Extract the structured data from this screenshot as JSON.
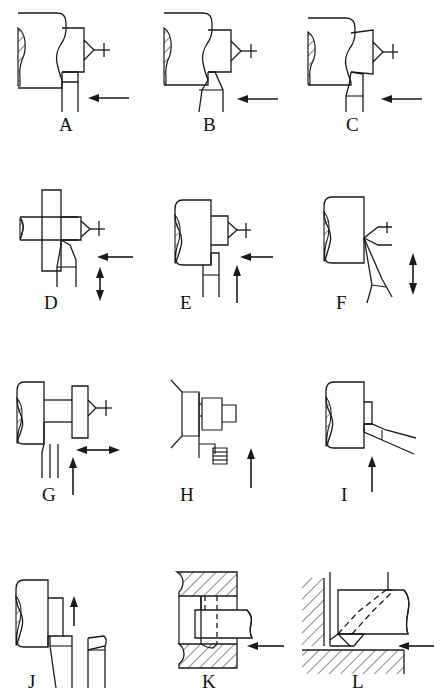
{
  "figure": {
    "stroke_color": "#1a1a1a",
    "background_color": "#ffffff",
    "columns": 3,
    "rows": 4
  },
  "panels": [
    {
      "id": "A",
      "label": "A",
      "operation": "straight-longitudinal-turning",
      "workpiece": "shaft-held-between-centers",
      "tool": "straight-turning-tool",
      "feed_arrows": [
        {
          "name": "feed-arrow-left",
          "direction": "left",
          "style": "single"
        }
      ]
    },
    {
      "id": "B",
      "label": "B",
      "operation": "longitudinal-turning-angled-tool",
      "workpiece": "shaft-held-between-centers",
      "tool": "angled-turning-tool",
      "feed_arrows": [
        {
          "name": "feed-arrow-left",
          "direction": "left",
          "style": "single"
        }
      ]
    },
    {
      "id": "C",
      "label": "C",
      "operation": "longitudinal-turning-round-nose-tool",
      "workpiece": "shaft-held-between-centers",
      "tool": "round-nose-turning-tool",
      "feed_arrows": [
        {
          "name": "feed-arrow-left",
          "direction": "left",
          "style": "single"
        }
      ]
    },
    {
      "id": "D",
      "label": "D",
      "operation": "form-turning-with-shoulder",
      "workpiece": "shaft-with-flange",
      "tool": "angled-form-tool",
      "feed_arrows": [
        {
          "name": "feed-arrow-left",
          "direction": "left",
          "style": "single"
        },
        {
          "name": "feed-arrow-vertical-double",
          "direction": "vertical",
          "style": "double"
        }
      ]
    },
    {
      "id": "E",
      "label": "E",
      "operation": "facing-and-turning-combined",
      "workpiece": "shaft-held-between-centers",
      "tool": "square-shoulder-tool",
      "feed_arrows": [
        {
          "name": "feed-arrow-left",
          "direction": "left",
          "style": "single"
        },
        {
          "name": "feed-arrow-up",
          "direction": "up",
          "style": "single"
        }
      ]
    },
    {
      "id": "F",
      "label": "F",
      "operation": "facing-end-of-workpiece",
      "workpiece": "shaft-held-between-centers",
      "tool": "facing-tool-angled",
      "feed_arrows": [
        {
          "name": "feed-arrow-vertical-double",
          "direction": "vertical",
          "style": "double"
        }
      ]
    },
    {
      "id": "G",
      "label": "G",
      "operation": "grooving-and-parting",
      "workpiece": "shaft-with-collar",
      "tool": "grooving-tool-pair",
      "feed_arrows": [
        {
          "name": "feed-arrow-horizontal-double",
          "direction": "horizontal",
          "style": "double"
        },
        {
          "name": "feed-arrow-up",
          "direction": "up",
          "style": "single"
        }
      ]
    },
    {
      "id": "H",
      "label": "H",
      "operation": "thread-cutting",
      "workpiece": "stepped-shaft",
      "tool": "threading-tool",
      "feed_arrows": [
        {
          "name": "feed-arrow-up",
          "direction": "up",
          "style": "single"
        }
      ]
    },
    {
      "id": "I",
      "label": "I",
      "operation": "chamfering-taper-turning",
      "workpiece": "shaft-held-between-centers",
      "tool": "chamfer-tool",
      "feed_arrows": [
        {
          "name": "feed-arrow-up",
          "direction": "up",
          "style": "single"
        }
      ]
    },
    {
      "id": "J",
      "label": "J",
      "operation": "parting-off",
      "workpiece": "shaft-end",
      "tool": "parting-blade",
      "feed_arrows": [
        {
          "name": "feed-arrow-up",
          "direction": "up",
          "style": "single"
        }
      ]
    },
    {
      "id": "K",
      "label": "K",
      "operation": "internal-boring",
      "workpiece": "hollow-bored-part-sectioned",
      "tool": "boring-bar",
      "feed_arrows": [
        {
          "name": "feed-arrow-left",
          "direction": "left",
          "style": "single"
        }
      ]
    },
    {
      "id": "L",
      "label": "L",
      "operation": "internal-corner-recessing",
      "workpiece": "sectioned-bore-corner",
      "tool": "internal-recessing-tool",
      "feed_arrows": [
        {
          "name": "feed-arrow-left",
          "direction": "left",
          "style": "single"
        }
      ]
    }
  ]
}
